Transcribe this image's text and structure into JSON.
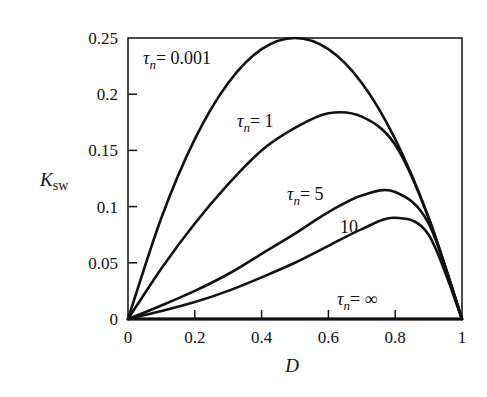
{
  "chart_data": {
    "type": "line",
    "title": "",
    "xlabel": "D",
    "ylabel": "K_sw",
    "xlim": [
      0,
      1
    ],
    "ylim": [
      0,
      0.25
    ],
    "grid": false,
    "legend_position": "inline curve labels",
    "data_note": "Values are approximate, digitized by eye from the image pixels (~0.005 precision). They were not computed from any formula.",
    "xticks": [
      0,
      0.2,
      0.4,
      0.6,
      0.8,
      1
    ],
    "xtick_labels": [
      "0",
      "0.2",
      "0.4",
      "0.6",
      "0.8",
      "1"
    ],
    "yticks": [
      0,
      0.05,
      0.1,
      0.15,
      0.2,
      0.25
    ],
    "ytick_labels": [
      "0",
      "0.05",
      "0.1",
      "0.15",
      "0.2",
      "0.25"
    ],
    "x": [
      0,
      0.1,
      0.2,
      0.3,
      0.4,
      0.5,
      0.6,
      0.7,
      0.8,
      0.9,
      1.0
    ],
    "series": [
      {
        "name": "τn = 0.001",
        "label_text": "= 0.001",
        "values": [
          0,
          0.09,
          0.16,
          0.21,
          0.24,
          0.25,
          0.24,
          0.21,
          0.16,
          0.09,
          0
        ]
      },
      {
        "name": "τn = 1",
        "label_text": "= 1",
        "values": [
          0,
          0.045,
          0.085,
          0.12,
          0.15,
          0.17,
          0.183,
          0.18,
          0.155,
          0.09,
          0
        ]
      },
      {
        "name": "τn = 5",
        "label_text": "= 5",
        "values": [
          0,
          0.012,
          0.025,
          0.04,
          0.058,
          0.076,
          0.095,
          0.11,
          0.113,
          0.085,
          0
        ]
      },
      {
        "name": "τn = 10",
        "label_text": "10",
        "values": [
          0,
          0.007,
          0.015,
          0.025,
          0.037,
          0.05,
          0.065,
          0.08,
          0.09,
          0.075,
          0
        ]
      },
      {
        "name": "τn = ∞",
        "label_text": "= ∞",
        "values": [
          0,
          0,
          0,
          0,
          0,
          0,
          0,
          0,
          0,
          0,
          0
        ]
      }
    ]
  }
}
